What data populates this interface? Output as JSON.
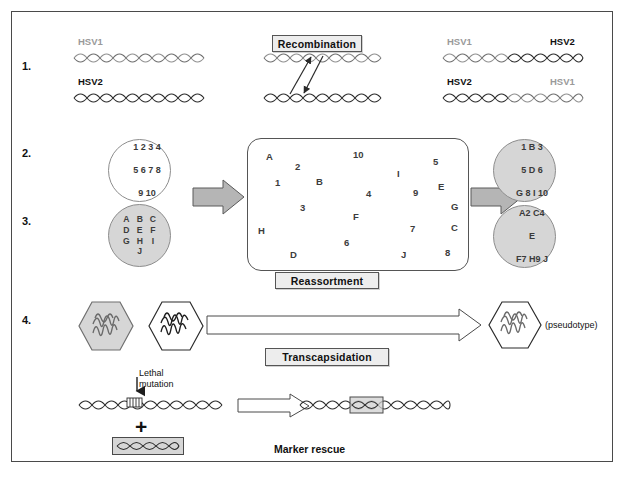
{
  "figure": {
    "title_rows": [
      "1.",
      "2.",
      "3.",
      "4."
    ],
    "background": "#ffffff",
    "border_color": "#4a4a4a"
  },
  "colors": {
    "gray_fill": "#d6d6d6",
    "label_box_fill": "#ededed",
    "hsv1_gray": "#9a9a9a",
    "hsv2_black": "#111111",
    "arrow_gray": "#b5b5b5",
    "text_dark": "#3c3c3c"
  },
  "row1": {
    "number": "1.",
    "left": {
      "top_label": "HSV1",
      "bottom_label": "HSV2"
    },
    "middle": {
      "process_label": "Recombination"
    },
    "right": {
      "top_left_label": "HSV1",
      "top_right_label": "HSV2",
      "bottom_left_label": "HSV2",
      "bottom_right_label": "HSV1"
    }
  },
  "row2": {
    "number": "2.",
    "input_circle": {
      "fill": "white",
      "lines": [
        "1 2 3 4",
        "5 6 7 8",
        "9 10"
      ]
    },
    "output_circle": {
      "fill": "gray",
      "lines": [
        "1 B 3",
        "5 D 6",
        "G 8 I 10"
      ]
    }
  },
  "row3": {
    "number": "3.",
    "input_circle": {
      "fill": "gray",
      "columns": [
        [
          "A",
          "D",
          "G"
        ],
        [
          "B",
          "E",
          "H",
          "J"
        ],
        [
          "C",
          "F",
          "I"
        ]
      ]
    },
    "output_circle": {
      "fill": "gray",
      "lines": [
        "A2 C4",
        "E",
        "F7 H9 J"
      ]
    }
  },
  "reassortment": {
    "process_label": "Reassortment",
    "pool_items": [
      {
        "t": "A",
        "x": 18,
        "y": 12
      },
      {
        "t": "2",
        "x": 47,
        "y": 22
      },
      {
        "t": "10",
        "x": 105,
        "y": 10
      },
      {
        "t": "5",
        "x": 185,
        "y": 17
      },
      {
        "t": "1",
        "x": 27,
        "y": 38
      },
      {
        "t": "B",
        "x": 68,
        "y": 37
      },
      {
        "t": "I",
        "x": 149,
        "y": 29
      },
      {
        "t": "4",
        "x": 118,
        "y": 49
      },
      {
        "t": "9",
        "x": 165,
        "y": 48
      },
      {
        "t": "E",
        "x": 190,
        "y": 42
      },
      {
        "t": "3",
        "x": 52,
        "y": 63
      },
      {
        "t": "G",
        "x": 203,
        "y": 62
      },
      {
        "t": "F",
        "x": 105,
        "y": 72
      },
      {
        "t": "7",
        "x": 162,
        "y": 84
      },
      {
        "t": "C",
        "x": 203,
        "y": 83
      },
      {
        "t": "H",
        "x": 10,
        "y": 86
      },
      {
        "t": "6",
        "x": 96,
        "y": 98
      },
      {
        "t": "D",
        "x": 42,
        "y": 110
      },
      {
        "t": "J",
        "x": 153,
        "y": 110
      },
      {
        "t": "8",
        "x": 197,
        "y": 108
      }
    ]
  },
  "row4": {
    "number": "4.",
    "process_label": "Transcapsidation",
    "pseudotype_label": "(pseudotype)",
    "capsid_left_fill": "gray",
    "capsid_right_fill": "white"
  },
  "marker_rescue": {
    "mutation_label_line1": "Lethal",
    "mutation_label_line2": "mutation",
    "plus_sign": "+",
    "caption": "Marker rescue"
  }
}
